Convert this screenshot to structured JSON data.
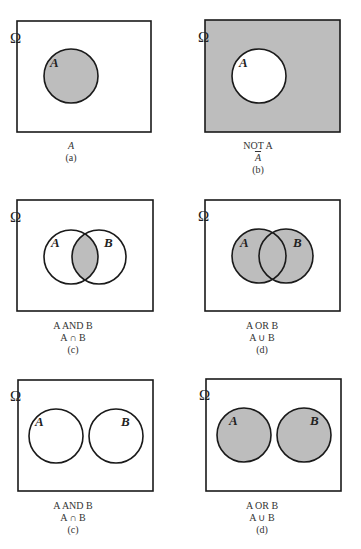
{
  "colors": {
    "fill": "#bdbdbd",
    "stroke": "#1a1a1a",
    "background": "#ffffff"
  },
  "universe_symbol": "Ω",
  "panels": [
    {
      "id": "a",
      "line1": "A",
      "line2": "",
      "label": "(a)",
      "sets": [
        "A"
      ],
      "shaded": "A"
    },
    {
      "id": "b",
      "line1": "NOT A",
      "line2": "A",
      "label": "(b)",
      "sets": [
        "A"
      ],
      "shaded": "complement of A"
    },
    {
      "id": "c",
      "line1": "A AND B",
      "line2": "A ∩ B",
      "label": "(c)",
      "sets": [
        "A",
        "B"
      ],
      "shaded": "intersection"
    },
    {
      "id": "d",
      "line1": "A OR B",
      "line2": "A ∪ B",
      "label": "(d)",
      "sets": [
        "A",
        "B"
      ],
      "shaded": "union"
    },
    {
      "id": "e",
      "line1": "A AND B",
      "line2": "A ∩ B",
      "label": "(c)",
      "sets": [
        "A",
        "B"
      ],
      "shaded": "none (disjoint)"
    },
    {
      "id": "f",
      "line1": "A OR B",
      "line2": "A ∪ B",
      "label": "(d)",
      "sets": [
        "A",
        "B"
      ],
      "shaded": "union (disjoint)"
    }
  ],
  "set_labels": {
    "a": "A",
    "b": "B"
  }
}
